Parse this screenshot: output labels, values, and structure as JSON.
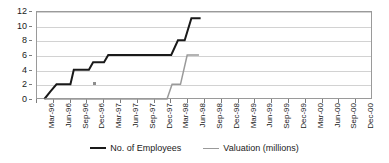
{
  "chart_data": {
    "type": "line",
    "title": "",
    "subtitle": "",
    "xlabel": "",
    "ylabel": "",
    "ylim": [
      0,
      12
    ],
    "ytick_step": 2,
    "ytick_labels": [
      "0",
      "2",
      "4",
      "6",
      "8",
      "10",
      "12"
    ],
    "grid": true,
    "legend_position": "bottom",
    "step_style": "post",
    "categories": [
      "Mar-96",
      "Jun-96",
      "Sep-96",
      "Dec-96",
      "Mar-97",
      "Jun-97",
      "Sep-97",
      "Dec-97",
      "Mar-98",
      "Jun-98",
      "Sep-98",
      "Dec-98",
      "Mar-99",
      "Jun-99",
      "Sep-99",
      "Dec-99",
      "Mar-00",
      "Jun-00",
      "Sep-00",
      "Dec-00"
    ],
    "series": [
      {
        "name": "No. of Employees",
        "color": "#1a1a1a",
        "values": [
          0,
          2,
          4,
          4,
          6,
          6,
          6,
          6,
          11,
          null,
          null,
          null,
          null,
          null,
          null,
          null,
          null,
          null,
          null,
          null
        ]
      },
      {
        "name": "Valuation (millions)",
        "color": "#9a9a9a",
        "values": [
          0,
          0,
          0,
          0,
          0,
          0,
          0,
          0,
          6,
          null,
          null,
          null,
          null,
          null,
          null,
          null,
          null,
          null,
          null,
          null
        ]
      }
    ],
    "employees_steps": [
      {
        "x": 0.0,
        "y": 0
      },
      {
        "x": 0.35,
        "y": 1
      },
      {
        "x": 0.72,
        "y": 2
      },
      {
        "x": 1.55,
        "y": 2
      },
      {
        "x": 1.75,
        "y": 4
      },
      {
        "x": 2.65,
        "y": 4
      },
      {
        "x": 2.9,
        "y": 5
      },
      {
        "x": 3.55,
        "y": 5
      },
      {
        "x": 3.8,
        "y": 6
      },
      {
        "x": 7.55,
        "y": 6
      },
      {
        "x": 7.95,
        "y": 8
      },
      {
        "x": 8.35,
        "y": 8
      },
      {
        "x": 8.75,
        "y": 11
      },
      {
        "x": 9.3,
        "y": 11
      }
    ],
    "valuation_steps": [
      {
        "x": 0.0,
        "y": 0
      },
      {
        "x": 7.3,
        "y": 0
      },
      {
        "x": 7.6,
        "y": 2
      },
      {
        "x": 8.1,
        "y": 2
      },
      {
        "x": 8.5,
        "y": 6
      },
      {
        "x": 9.2,
        "y": 6
      }
    ],
    "annotations": [
      {
        "name": "stray-marker",
        "x": 3.0,
        "y": 2.1
      }
    ]
  },
  "legend": {
    "entries": [
      {
        "label": "No. of Employees",
        "color": "#1a1a1a",
        "width": "2px"
      },
      {
        "label": "Valuation (millions)",
        "color": "#9a9a9a",
        "width": "1.5px"
      }
    ]
  }
}
